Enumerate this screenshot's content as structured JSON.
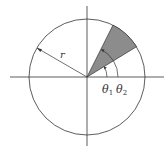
{
  "diagram": {
    "type": "polar-sector",
    "center": [
      87,
      77
    ],
    "radius": 58,
    "theta1_deg": 31.5,
    "theta2_deg": 63.4,
    "labels": {
      "radius": "r",
      "theta1": "θ",
      "theta1_sub": "1",
      "theta2": "θ",
      "theta2_sub": "2"
    },
    "colors": {
      "stroke": "#333333",
      "sector_fill": "#8c8c8c",
      "background": "#ffffff"
    }
  }
}
